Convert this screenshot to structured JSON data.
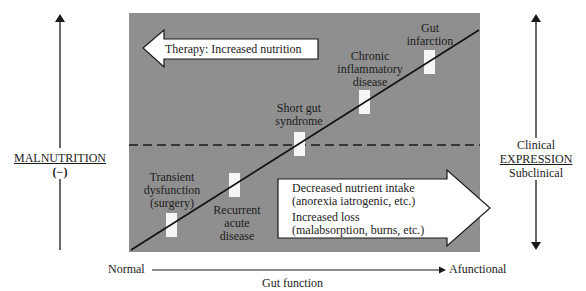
{
  "diagram": {
    "panel_color": "#8f8f8f",
    "threshold_line": "dashed",
    "left_axis": {
      "title": "MALNUTRITION",
      "sign": "(−)"
    },
    "right_axis": {
      "top_label": "Clinical",
      "title": "EXPRESSION",
      "bottom_label": "Subclinical"
    },
    "bottom_axis": {
      "start_label": "Normal",
      "end_label": "Afunctional",
      "title": "Gut function"
    },
    "therapy_arrow": {
      "label": "Therapy: Increased nutrition",
      "direction": "left"
    },
    "cause_arrow": {
      "direction": "right",
      "line1": "Decreased nutrient intake",
      "line2": "(anorexia iatrogenic, etc.)",
      "line3": "Increased loss",
      "line4": "(malabsorption, burns, etc.)"
    },
    "conditions": [
      {
        "line1": "Transient",
        "line2": "dysfunction",
        "line3": "(surgery)"
      },
      {
        "line1": "Recurrent",
        "line2": "acute",
        "line3": "disease"
      },
      {
        "line1": "Short gut",
        "line2": "syndrome"
      },
      {
        "line1": "Chronic",
        "line2": "inflammatory",
        "line3": "disease"
      },
      {
        "line1": "Gut",
        "line2": "infarction"
      }
    ]
  }
}
